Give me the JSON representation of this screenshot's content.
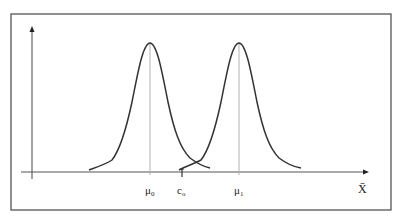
{
  "diagram": {
    "x_axis_label": "X̄",
    "labels": {
      "mu0": "μ",
      "mu0_sub": "0",
      "c0": "c",
      "c0_sub": "o",
      "mu1": "μ",
      "mu1_sub": "1"
    },
    "curves": [
      {
        "name": "H0 distribution",
        "center_label": "μ0"
      },
      {
        "name": "H1 distribution",
        "center_label": "μ1"
      }
    ],
    "colors": {
      "frame": "#555555",
      "axis": "#444444",
      "curve": "#333333",
      "center_line": "#aaaaaa"
    }
  }
}
